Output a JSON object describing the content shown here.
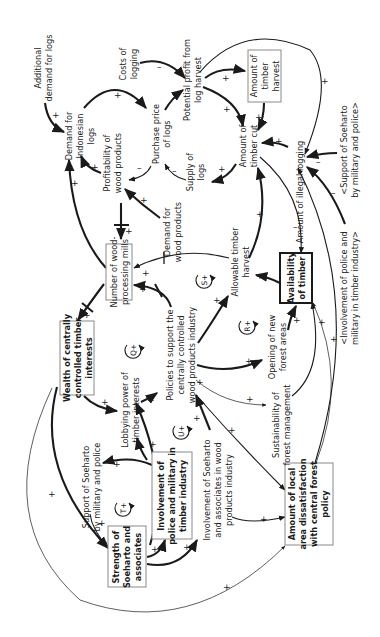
{
  "diagram": {
    "type": "causal-loop-diagram",
    "orientation": "rotated-90-ccw",
    "colors": {
      "ink": "#1a1a1a",
      "box_border": "#8a8a8a",
      "background": "#ffffff"
    },
    "variables": {
      "additional_demand": [
        "Additional",
        "demand for logs"
      ],
      "demand_indonesian_logs": [
        "Demand for",
        "Indonesian",
        "logs"
      ],
      "costs_logging": [
        "Costs of",
        "logging"
      ],
      "purchase_price": [
        "Purchase price",
        "of logs"
      ],
      "potential_profit": [
        "Potential profit from",
        "log harvest"
      ],
      "timber_harvest": [
        "Amount of",
        "timber",
        "harvest"
      ],
      "profitability": [
        "Profitability of",
        "wood products"
      ],
      "supply_logs": [
        "Supply of",
        "logs"
      ],
      "amount_timber_cut": [
        "Amount of",
        "timber cut"
      ],
      "demand_wood_products": [
        "Demand for",
        "wood products"
      ],
      "illegal_logging": [
        "Amount of illegal logging"
      ],
      "support_ghost": [
        "<Support of Soeharto",
        "by military and police>"
      ],
      "involvement_ghost": [
        "<Involvement of police and",
        "military in timber industry>"
      ],
      "wood_mills": [
        "Number of wood-",
        "processing mills"
      ],
      "allowable_harvest": [
        "Allowable timber",
        "harvest"
      ],
      "availability_timber": [
        "Availability",
        "of timber"
      ],
      "wealth": [
        "Wealth of centrally",
        "controlled timber",
        "interests"
      ],
      "policies": [
        "Policies to support the",
        "centrally controlled",
        "wood products industry"
      ],
      "opening_forest": [
        "Opening of new",
        "forest areas"
      ],
      "lobbying": [
        "Lobbying power of",
        "timber interests"
      ],
      "sustainability": [
        "Sustainability of",
        "forest management"
      ],
      "support_soeharto": [
        "Support of Soeharto",
        "by military and police"
      ],
      "involvement_police": [
        "Involvement of",
        "police and military in",
        "timber industry"
      ],
      "involvement_soeharto": [
        "Involvement of Soeharto",
        "and associates in wood",
        "products industry"
      ],
      "strength_soeharto": [
        "Strength of",
        "Soeharto and",
        "associates"
      ],
      "local_dissatisfaction": [
        "Amount of local",
        "area dissatisfaction",
        "with central forest",
        "policy"
      ]
    },
    "loops": [
      {
        "id": "Q",
        "label": "Q+"
      },
      {
        "id": "S",
        "label": "S+"
      },
      {
        "id": "R",
        "label": "R+"
      },
      {
        "id": "U",
        "label": "U+"
      },
      {
        "id": "T",
        "label": "T+"
      }
    ],
    "links": [
      {
        "from": "Additional demand for logs",
        "to": "Demand for Indonesian logs",
        "polarity": "+"
      },
      {
        "from": "Demand for Indonesian logs",
        "to": "Purchase price of logs",
        "polarity": "+"
      },
      {
        "from": "Costs of logging",
        "to": "Potential profit from log harvest",
        "polarity": "-"
      },
      {
        "from": "Purchase price of logs",
        "to": "Potential profit from log harvest",
        "polarity": "+"
      },
      {
        "from": "Potential profit from log harvest",
        "to": "Amount of timber harvest",
        "polarity": "+"
      },
      {
        "from": "Potential profit from log harvest",
        "to": "Amount of timber cut",
        "polarity": "+"
      },
      {
        "from": "Potential profit from log harvest",
        "to": "Amount of illegal logging",
        "polarity": "+"
      },
      {
        "from": "Amount of timber harvest",
        "to": "Amount of timber cut",
        "polarity": "+"
      },
      {
        "from": "Purchase price of logs",
        "to": "Profitability of wood products",
        "polarity": "-"
      },
      {
        "from": "Profitability of wood products",
        "to": "Demand for Indonesian logs",
        "polarity": "+"
      },
      {
        "from": "Supply of logs",
        "to": "Purchase price of logs",
        "polarity": "-"
      },
      {
        "from": "Amount of timber cut",
        "to": "Supply of logs",
        "polarity": "+"
      },
      {
        "from": "Demand for wood products",
        "to": "Profitability of wood products",
        "polarity": "+"
      },
      {
        "from": "Amount of illegal logging",
        "to": "Amount of timber cut",
        "polarity": "+"
      },
      {
        "from": "<Support of Soeharto by military and police>",
        "to": "Amount of illegal logging",
        "polarity": "-"
      },
      {
        "from": "<Involvement of police and military in timber industry>",
        "to": "Amount of illegal logging",
        "polarity": "-"
      },
      {
        "from": "Amount of timber cut",
        "to": "Availability of timber",
        "polarity": "-"
      },
      {
        "from": "Allowable timber harvest",
        "to": "Amount of timber cut",
        "polarity": "+"
      },
      {
        "from": "Availability of timber",
        "to": "Allowable timber harvest",
        "polarity": "+"
      },
      {
        "from": "Profitability of wood products",
        "to": "Number of wood-processing mills",
        "polarity": "+",
        "delay": true
      },
      {
        "from": "Number of wood-processing mills",
        "to": "Demand for Indonesian logs",
        "polarity": "+"
      },
      {
        "from": "Allowable timber harvest",
        "to": "Number of wood-processing mills",
        "polarity": "+",
        "delay": true
      },
      {
        "from": "Policies to support the centrally controlled wood products industry",
        "to": "Number of wood-processing mills",
        "polarity": "+",
        "delay": true
      },
      {
        "from": "Number of wood-processing mills",
        "to": "Wealth of centrally controlled timber interests",
        "polarity": "+",
        "delay": true
      },
      {
        "from": "Policies to support the centrally controlled wood products industry",
        "to": "Allowable timber harvest",
        "polarity": "+"
      },
      {
        "from": "Policies to support the centrally controlled wood products industry",
        "to": "Opening of new forest areas",
        "polarity": "+"
      },
      {
        "from": "Policies to support the centrally controlled wood products industry",
        "to": "Sustainability of forest management",
        "polarity": "+"
      },
      {
        "from": "Opening of new forest areas",
        "to": "Availability of timber",
        "polarity": "+"
      },
      {
        "from": "Sustainability of forest management",
        "to": "Availability of timber",
        "polarity": "+"
      },
      {
        "from": "Wealth of centrally controlled timber interests",
        "to": "Lobbying power of timber interests",
        "polarity": "+"
      },
      {
        "from": "Lobbying power of timber interests",
        "to": "Policies to support the centrally controlled wood products industry",
        "polarity": "+"
      },
      {
        "from": "Involvement of police and military in timber industry",
        "to": "Lobbying power of timber interests",
        "polarity": "+"
      },
      {
        "from": "Involvement of police and military in timber industry",
        "to": "Support of Soeharto by military and police",
        "polarity": "+"
      },
      {
        "from": "Support of Soeharto by military and police",
        "to": "Strength of Soeharto and associates",
        "polarity": "+"
      },
      {
        "from": "Wealth of centrally controlled timber interests",
        "to": "Strength of Soeharto and associates",
        "polarity": "+"
      },
      {
        "from": "Strength of Soeharto and associates",
        "to": "Involvement of police and military in timber industry",
        "polarity": "+"
      },
      {
        "from": "Strength of Soeharto and associates",
        "to": "Involvement of Soeharto and associates in wood products industry",
        "polarity": "+"
      },
      {
        "from": "Involvement of Soeharto and associates in wood products industry",
        "to": "Policies to support the centrally controlled wood products industry",
        "polarity": "+"
      },
      {
        "from": "Involvement of Soeharto and associates in wood products industry",
        "to": "Amount of local area dissatisfaction with central forest policy",
        "polarity": "+"
      },
      {
        "from": "Policies to support the centrally controlled wood products industry",
        "to": "Amount of local area dissatisfaction with central forest policy",
        "polarity": "+"
      },
      {
        "from": "Wealth of centrally controlled timber interests",
        "to": "Amount of local area dissatisfaction with central forest policy",
        "polarity": "+"
      },
      {
        "from": "Amount of local area dissatisfaction with central forest policy",
        "to": "Amount of illegal logging",
        "polarity": "+"
      },
      {
        "from": "Amount of local area dissatisfaction with central forest policy",
        "to": "Availability of timber",
        "polarity": "+"
      }
    ],
    "signs": {
      "plus": "+",
      "minus": "–"
    }
  }
}
